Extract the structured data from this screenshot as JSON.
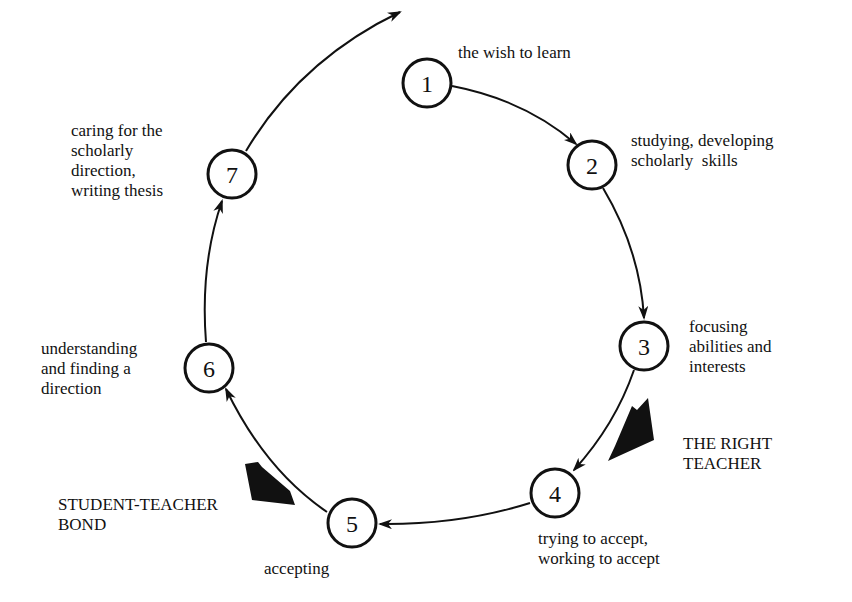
{
  "diagram": {
    "type": "cycle",
    "colors": {
      "stroke": "#111111",
      "background": "#ffffff",
      "text": "#111111"
    },
    "nodes": [
      {
        "id": "1",
        "label": "the wish to learn"
      },
      {
        "id": "2",
        "label": "studying, developing\nscholarly  skills"
      },
      {
        "id": "3",
        "label": "focusing\nabilities and\ninterests"
      },
      {
        "id": "4",
        "label": "trying to accept,\nworking to accept"
      },
      {
        "id": "5",
        "label": "accepting"
      },
      {
        "id": "6",
        "label": "understanding\nand finding a\ndirection"
      },
      {
        "id": "7",
        "label": "caring for the\nscholarly\ndirection,\nwriting thesis"
      }
    ],
    "edges": [
      {
        "from": "1",
        "to": "2"
      },
      {
        "from": "2",
        "to": "3"
      },
      {
        "from": "3",
        "to": "4"
      },
      {
        "from": "4",
        "to": "5"
      },
      {
        "from": "5",
        "to": "6"
      },
      {
        "from": "6",
        "to": "7"
      },
      {
        "from": "7",
        "to": "next-cycle"
      }
    ],
    "influences": [
      {
        "label": "THE RIGHT\nTEACHER",
        "acts_on": "3-4"
      },
      {
        "label": "STUDENT-TEACHER\nBOND",
        "acts_on": "5-6"
      }
    ]
  }
}
